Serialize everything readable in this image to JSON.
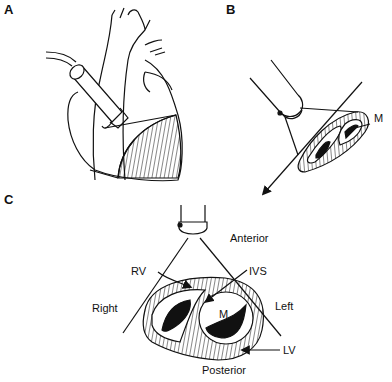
{
  "figure": {
    "colors": {
      "line": "#111111",
      "background": "#ffffff"
    },
    "panels": [
      {
        "id": "A",
        "label": "A",
        "description": "Transducer on chest aimed at heart with short-axis imaging plane (hatched)"
      },
      {
        "id": "B",
        "label": "B",
        "description": "Transducer beam sector through short-axis slice of ventricles",
        "annotations": {
          "mitral": "M"
        }
      },
      {
        "id": "C",
        "label": "C",
        "description": "Short-axis cross section orientation",
        "annotations": {
          "anterior": "Anterior",
          "posterior": "Posterior",
          "right": "Right",
          "left": "Left",
          "rv": "RV",
          "ivs": "IVS",
          "mitral": "M",
          "lv": "LV"
        }
      }
    ]
  }
}
